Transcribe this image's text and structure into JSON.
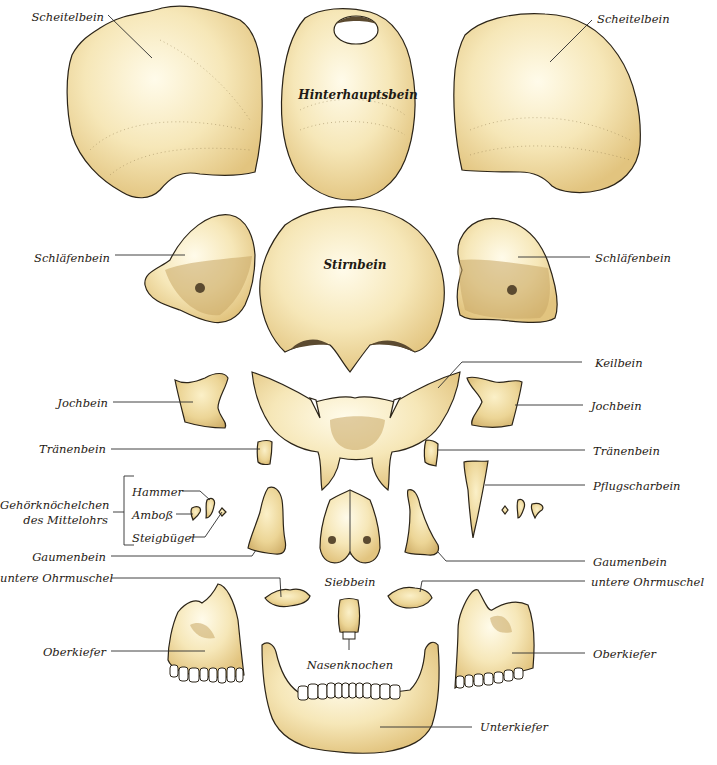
{
  "diagram": {
    "colors": {
      "bone_light": "#fbf3d6",
      "bone_mid": "#f1dfa6",
      "bone_dark": "#d8b771",
      "outline": "#2b2418",
      "leader": "#2d2d2d",
      "background": "#ffffff"
    },
    "labels": {
      "scheitelbein_left": "Scheitelbein",
      "scheitelbein_right": "Scheitelbein",
      "hinterhauptsbein": "Hinterhauptsbein",
      "schlaefenbein_left": "Schläfenbein",
      "schlaefenbein_right": "Schläfenbein",
      "stirnbein": "Stirnbein",
      "keilbein": "Keilbein",
      "jochbein_left": "Jochbein",
      "jochbein_right": "Jochbein",
      "traenenbein_left": "Tränenbein",
      "traenenbein_right": "Tränenbein",
      "pflugscharbein": "Pflugscharbein",
      "gehoerknoechelchen_line1": "Gehörknöchelchen",
      "gehoerknoechelchen_line2": "des Mittelohrs",
      "hammer": "Hammer",
      "amboss": "Amboß",
      "steigbuegel": "Steigbügel",
      "gaumenbein_left": "Gaumenbein",
      "gaumenbein_right": "Gaumenbein",
      "siebbein": "Siebbein",
      "untere_ohrmuschel_left": "untere Ohrmuschel",
      "untere_ohrmuschel_right": "untere Ohrmuschel",
      "oberkiefer_left": "Oberkiefer",
      "oberkiefer_right": "Oberkiefer",
      "nasenknochen": "Nasenknochen",
      "unterkiefer": "Unterkiefer"
    }
  }
}
